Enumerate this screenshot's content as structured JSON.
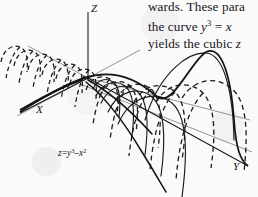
{
  "page": {
    "background_color": "#fafafa",
    "ink_color": "#1a1a1e"
  },
  "figure": {
    "name": "surface-plot-cubic",
    "caption_equation": {
      "full": "z=y3–x2",
      "lhs": "z",
      "equals": "=",
      "term1_base": "y",
      "term1_exp": "3",
      "minus": "–",
      "term2_base": "x",
      "term2_exp": "2"
    },
    "axes": [
      {
        "label": "Z",
        "name": "z-axis",
        "direction": "up"
      },
      {
        "label": "X",
        "name": "x-axis",
        "direction": "down-left"
      },
      {
        "label": "Y",
        "name": "y-axis",
        "direction": "down-right"
      }
    ],
    "style": {
      "solid_curve_color": "#1a1a1e",
      "dashed_curve_color": "#1a1a1e",
      "guide_line_color": "#6b6b72"
    }
  },
  "body_text": {
    "lines": [
      {
        "id": "line1",
        "text": "wards. These para"
      },
      {
        "id": "line2",
        "prefix": "the curve ",
        "math_base": "y",
        "math_exp": "3",
        "math_rel": " = ",
        "math_var": "x"
      },
      {
        "id": "line3",
        "prefix": "yields the cubic ",
        "math_var": "z"
      }
    ]
  }
}
